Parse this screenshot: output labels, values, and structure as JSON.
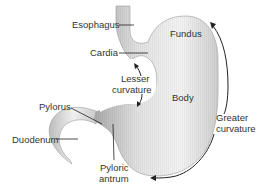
{
  "diagram": {
    "colors": {
      "organ_light": "#f4f4f4",
      "organ_mid": "#d6d6d6",
      "organ_dark": "#a9a9a9",
      "outline": "#9a9a9a",
      "leader": "#222222",
      "text": "#333333"
    },
    "labels": {
      "esophagus": "Esophagus",
      "cardia": "Cardia",
      "fundus": "Fundus",
      "lesser_curvature_1": "Lesser",
      "lesser_curvature_2": "curvature",
      "body": "Body",
      "pylorus": "Pylorus",
      "duodenum": "Duodenum",
      "pyloric_antrum_1": "Pyloric",
      "pyloric_antrum_2": "antrum",
      "greater_curvature_1": "Greater",
      "greater_curvature_2": "curvature"
    }
  }
}
